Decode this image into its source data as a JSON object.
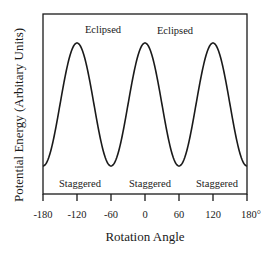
{
  "chart_data": {
    "type": "line",
    "title": "",
    "xlabel": "Rotation Angle",
    "ylabel": "Potential Energy (Arbitary Units)",
    "x_ticks": [
      "-180",
      "-120",
      "-60",
      "0",
      "60",
      "120",
      "180°"
    ],
    "x_tick_values": [
      -180,
      -120,
      -60,
      0,
      60,
      120,
      180
    ],
    "xlim": [
      -180,
      180
    ],
    "ylim": [
      0,
      1
    ],
    "grid": false,
    "legend": null,
    "series": [
      {
        "name": "Potential Energy",
        "function": "0.5 + 0.5*cos(3*theta)",
        "x": [
          -180,
          -150,
          -120,
          -90,
          -60,
          -30,
          0,
          30,
          60,
          90,
          120,
          150,
          180
        ],
        "values": [
          1,
          0.5,
          0,
          0.5,
          1,
          0.5,
          0,
          0.5,
          1,
          0.5,
          0,
          0.5,
          1
        ]
      }
    ],
    "annotations": [
      {
        "text": "Eclipsed",
        "x": -60,
        "position": "above-peak"
      },
      {
        "text": "Eclipsed",
        "x": 60,
        "position": "above-peak"
      },
      {
        "text": "Staggered",
        "x": -120,
        "position": "below-trough"
      },
      {
        "text": "Staggered",
        "x": 0,
        "position": "below-trough"
      },
      {
        "text": "Staggered",
        "x": 120,
        "position": "below-trough"
      }
    ]
  },
  "labels": {
    "xlabel": "Rotation Angle",
    "ylabel": "Potential Energy (Arbitary Units)",
    "eclipsed": "Eclipsed",
    "staggered": "Staggered",
    "ticks": [
      "-180",
      "-120",
      "-60",
      "0",
      "60",
      "120",
      "180°"
    ]
  }
}
